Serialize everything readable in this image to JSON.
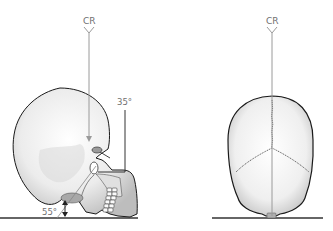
{
  "diagram": {
    "left_view": {
      "name": "lateral-skull-view",
      "cr_label": "CR",
      "angle_top_label": "35°",
      "angle_bottom_label": "55°"
    },
    "right_view": {
      "name": "posterior-skull-view",
      "cr_label": "CR"
    },
    "colors": {
      "ray": "#9a9a9a",
      "outline": "#1a1a1a",
      "bone_fill": "#ececec",
      "bone_shade": "#bdbdbd",
      "baseline": "#333333",
      "label": "#707070"
    }
  }
}
